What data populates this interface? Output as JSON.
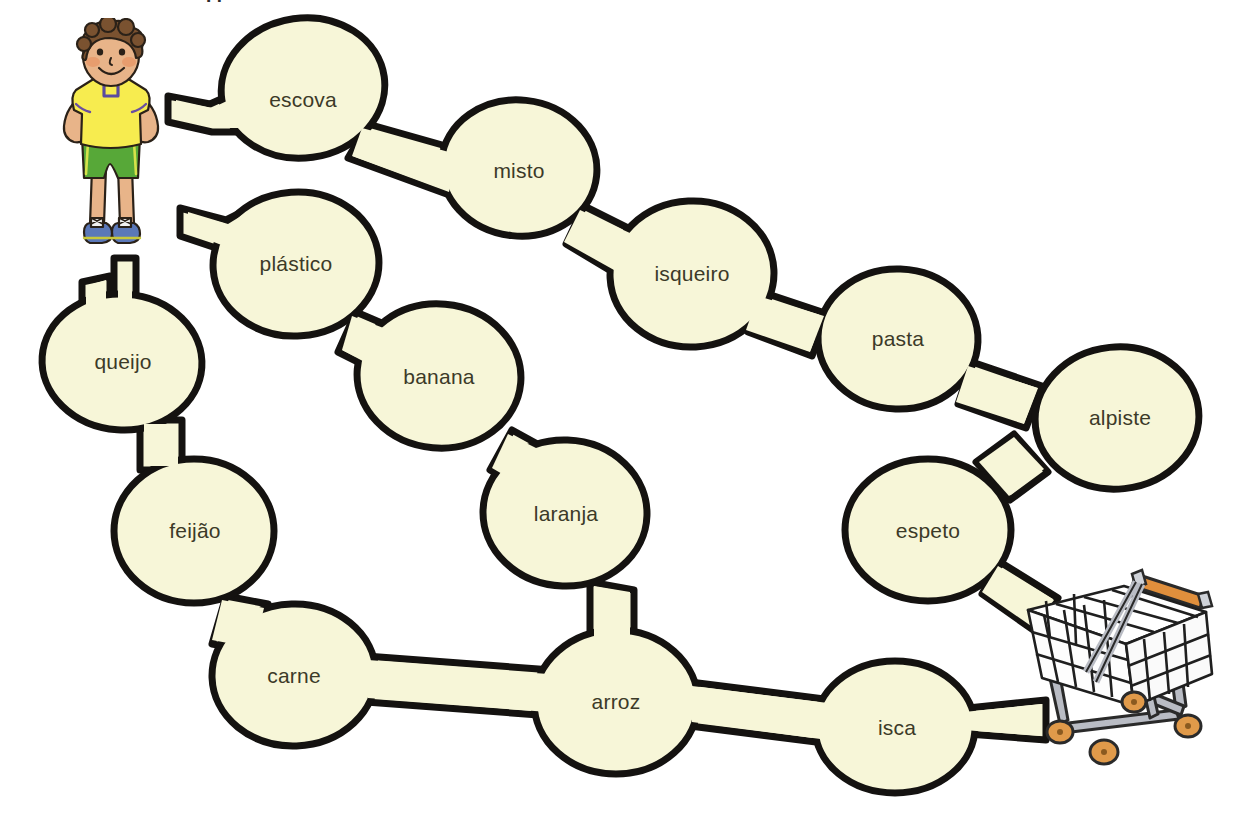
{
  "page": {
    "title_fragment_visible": "g",
    "background_color": "#ffffff",
    "bubble_fill": "#f7f6d8",
    "bubble_stroke": "#141210",
    "label_color": "#3c3a28"
  },
  "figures": [
    {
      "name": "boy-character",
      "alt": "boy standing with hands on hips, yellow t-shirt, green shorts, blue sneakers",
      "skin": "#e8b489",
      "hair": "#7a5230",
      "shirt": "#f7ec4f",
      "shorts": "#57a838",
      "shoes": "#5b78b8"
    },
    {
      "name": "shopping-cart",
      "alt": "metal shopping cart with orange handle and orange wheels",
      "frame": "#1a1a1a",
      "legs": "#b9bcc4",
      "handle": "#e08f3c",
      "wheels": "#e09a4a"
    }
  ],
  "maze": {
    "type": "word-path-maze",
    "start_label": "boy-character",
    "end_label": "shopping-cart",
    "bubbles": [
      {
        "id": "escova",
        "label": "escova",
        "cx": 303,
        "cy": 88,
        "rx": 82,
        "ry": 70,
        "rot": -8
      },
      {
        "id": "misto",
        "label": "misto",
        "cx": 519,
        "cy": 168,
        "rx": 78,
        "ry": 68,
        "rot": 6
      },
      {
        "id": "plastico",
        "label": "plástico",
        "cx": 296,
        "cy": 264,
        "rx": 83,
        "ry": 72,
        "rot": -4
      },
      {
        "id": "isqueiro",
        "label": "isqueiro",
        "cx": 692,
        "cy": 274,
        "rx": 82,
        "ry": 73,
        "rot": -3
      },
      {
        "id": "queijo",
        "label": "queijo",
        "cx": 122,
        "cy": 362,
        "rx": 80,
        "ry": 68,
        "rot": 4
      },
      {
        "id": "banana",
        "label": "banana",
        "cx": 439,
        "cy": 376,
        "rx": 82,
        "ry": 72,
        "rot": 5
      },
      {
        "id": "pasta",
        "label": "pasta",
        "cx": 898,
        "cy": 339,
        "rx": 80,
        "ry": 70,
        "rot": 2
      },
      {
        "id": "alpiste",
        "label": "alpiste",
        "cx": 1117,
        "cy": 418,
        "rx": 82,
        "ry": 71,
        "rot": -6
      },
      {
        "id": "feijao",
        "label": "feijão",
        "cx": 194,
        "cy": 531,
        "rx": 80,
        "ry": 72,
        "rot": 0
      },
      {
        "id": "laranja",
        "label": "laranja",
        "cx": 565,
        "cy": 513,
        "rx": 82,
        "ry": 73,
        "rot": 2
      },
      {
        "id": "espeto",
        "label": "espeto",
        "cx": 928,
        "cy": 530,
        "rx": 83,
        "ry": 71,
        "rot": 0
      },
      {
        "id": "carne",
        "label": "carne",
        "cx": 294,
        "cy": 675,
        "rx": 82,
        "ry": 71,
        "rot": -2
      },
      {
        "id": "arroz",
        "label": "arroz",
        "cx": 616,
        "cy": 702,
        "rx": 82,
        "ry": 72,
        "rot": 0
      },
      {
        "id": "isca",
        "label": "isca",
        "cx": 895,
        "cy": 727,
        "rx": 80,
        "ry": 66,
        "rot": 0
      }
    ],
    "connections": [
      {
        "from": "boy",
        "to": "escova"
      },
      {
        "from": "escova",
        "to": "misto"
      },
      {
        "from": "misto",
        "to": "isqueiro"
      },
      {
        "from": "isqueiro",
        "to": "pasta"
      },
      {
        "from": "pasta",
        "to": "alpiste"
      },
      {
        "from": "alpiste",
        "to": "espeto"
      },
      {
        "from": "espeto",
        "to": "cart"
      },
      {
        "from": "boy",
        "to": "plastico"
      },
      {
        "from": "plastico",
        "to": "banana"
      },
      {
        "from": "banana",
        "to": "laranja"
      },
      {
        "from": "laranja",
        "to": "arroz"
      },
      {
        "from": "boy",
        "to": "queijo"
      },
      {
        "from": "queijo",
        "to": "feijao"
      },
      {
        "from": "feijao",
        "to": "carne"
      },
      {
        "from": "carne",
        "to": "arroz"
      },
      {
        "from": "arroz",
        "to": "isca"
      },
      {
        "from": "isca",
        "to": "cart"
      }
    ]
  }
}
